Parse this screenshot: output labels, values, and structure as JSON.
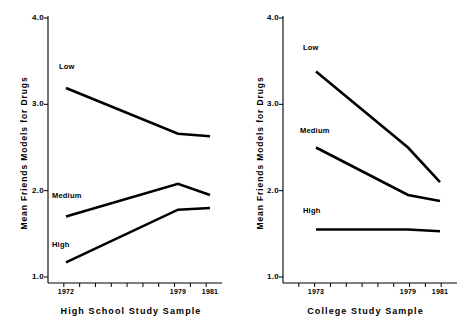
{
  "figure": {
    "background_color": "#ffffff",
    "line_color": "#000000",
    "panel_count": 2
  },
  "chart_data": [
    {
      "type": "line",
      "panel": "left",
      "title": "",
      "xlabel": "High School Study Sample",
      "ylabel": "Mean Friends Models for Drugs",
      "x": [
        1972,
        1979,
        1981
      ],
      "xtick_labels": [
        "1972",
        "1979",
        "1981"
      ],
      "ylim": [
        1.0,
        4.0
      ],
      "ytick_labels": [
        "1.0",
        "2.0",
        "3.0",
        "4.0"
      ],
      "ytick_values": [
        1.0,
        2.0,
        3.0,
        4.0
      ],
      "grid": false,
      "legend": "inline-labels",
      "series": [
        {
          "name": "Low",
          "values": [
            3.19,
            2.66,
            2.63
          ]
        },
        {
          "name": "Medium",
          "values": [
            1.7,
            2.08,
            1.95
          ]
        },
        {
          "name": "High",
          "values": [
            1.17,
            1.78,
            1.8
          ]
        }
      ]
    },
    {
      "type": "line",
      "panel": "right",
      "title": "",
      "xlabel": "College Study Sample",
      "ylabel": "Mean Friends Models for Drugs",
      "x": [
        1973,
        1979,
        1981
      ],
      "xtick_labels": [
        "1973",
        "1979",
        "1981"
      ],
      "ylim": [
        1.0,
        4.0
      ],
      "ytick_labels": [
        "1.0",
        "2.0",
        "3.0",
        "4.0"
      ],
      "ytick_values": [
        1.0,
        2.0,
        3.0,
        4.0
      ],
      "grid": false,
      "legend": "inline-labels",
      "series": [
        {
          "name": "Low",
          "values": [
            3.38,
            2.5,
            2.1
          ]
        },
        {
          "name": "Medium",
          "values": [
            2.5,
            1.95,
            1.88
          ]
        },
        {
          "name": "High",
          "values": [
            1.55,
            1.55,
            1.53
          ]
        }
      ]
    }
  ],
  "left_panel": {
    "ylabel": "Mean Friends Models for Drugs",
    "xlabel": "High School Study Sample",
    "yticks": [
      "4.0",
      "3.0",
      "2.0",
      "1.0"
    ],
    "xticks": [
      "1972",
      "1979",
      "1981"
    ],
    "series_labels": [
      "Low",
      "Medium",
      "High"
    ]
  },
  "right_panel": {
    "ylabel": "Mean Friends Models for Drugs",
    "xlabel": "College Study Sample",
    "yticks": [
      "4.0",
      "3.0",
      "2.0",
      "1.0"
    ],
    "xticks": [
      "1973",
      "1979",
      "1981"
    ],
    "series_labels": [
      "Low",
      "Medium",
      "High"
    ]
  }
}
